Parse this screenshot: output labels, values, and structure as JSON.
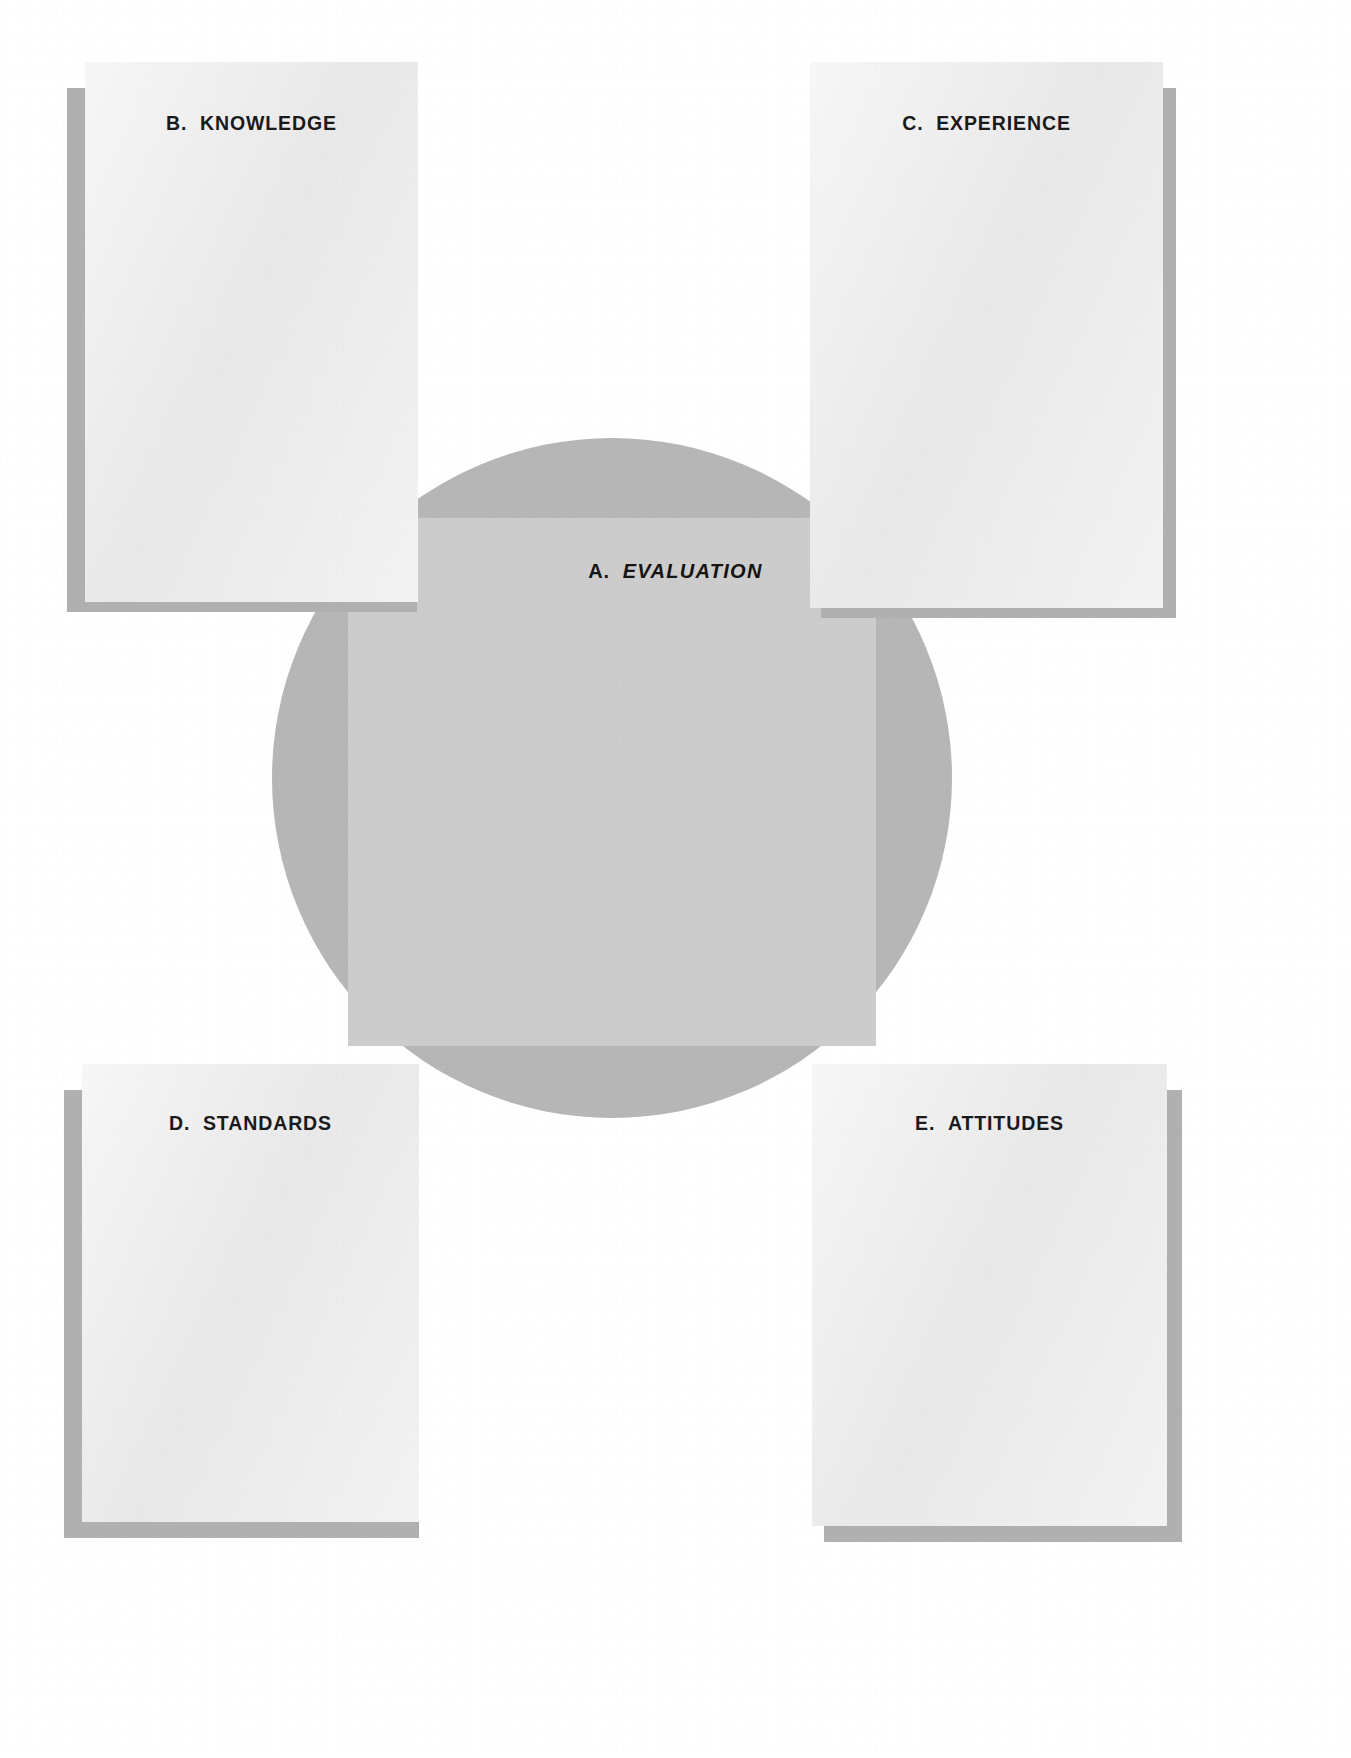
{
  "diagram": {
    "type": "hub-and-spoke concept diagram",
    "palette": {
      "page_background": "#ffffff",
      "circle_fill": "#b6b6b6",
      "band_fill": "#cccccc",
      "card_fill": "#ececec",
      "card_shadow": "#b0b0b0",
      "text": "#1a1a1a"
    },
    "centre": {
      "name": "evaluation-hub",
      "lead": "A.",
      "term": "EVALUATION",
      "full_label": "A.  EVALUATION",
      "style": "bold italic"
    },
    "cards": [
      {
        "key": "knowledge",
        "lead": "B.",
        "term": "KNOWLEDGE",
        "label": "B.  KNOWLEDGE",
        "position": "top-left"
      },
      {
        "key": "experience",
        "lead": "C.",
        "term": "EXPERIENCE",
        "label": "C.  EXPERIENCE",
        "position": "top-right"
      },
      {
        "key": "standards",
        "lead": "D.",
        "term": "STANDARDS",
        "label": "D.  STANDARDS",
        "position": "bottom-left"
      },
      {
        "key": "attitudes",
        "lead": "E.",
        "term": "ATTITUDES",
        "label": "E.  ATTITUDES",
        "position": "bottom-right"
      }
    ],
    "ghost_text": {
      "line_1": "",
      "line_2": ""
    }
  }
}
